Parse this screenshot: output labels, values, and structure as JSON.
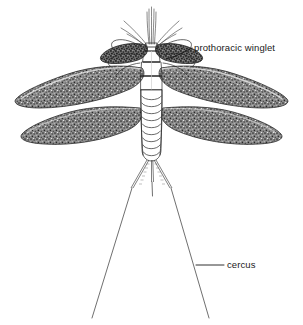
{
  "figure": {
    "background_color": "#ffffff",
    "ink_color": "#1a1a1a",
    "wing_fill_color": "#707070",
    "wing_outline_color": "#2a2a2a",
    "body_fill_color": "#ffffff"
  },
  "labels": [
    {
      "id": "prothoracic-winglet",
      "text": "prothoracic winglet",
      "text_x": 194,
      "text_y": 51,
      "leader": "M192,48 L176,56 L166,59",
      "font_size": 9.5
    },
    {
      "id": "cercus",
      "text": "cercus",
      "text_x": 227,
      "text_y": 268,
      "leader": "M224,265 L196,265",
      "font_size": 9.5
    }
  ],
  "anatomy": {
    "head": {
      "name": "head",
      "antennae_count": 2,
      "caudal_setae_count": 5
    },
    "thorax": {
      "name": "thorax",
      "segments": 3,
      "color": "#ffffff"
    },
    "abdomen": {
      "name": "abdomen",
      "segments": 9
    },
    "wings": {
      "name": "wings",
      "pairs": 2,
      "total": 4,
      "texture": "stippled"
    },
    "prothoracic_winglets": {
      "name": "prothoracic winglets",
      "count": 2
    },
    "cerci": {
      "name": "cerci",
      "count": 2,
      "median_filament": 1
    },
    "legs": {
      "name": "legs",
      "count": 6
    }
  }
}
